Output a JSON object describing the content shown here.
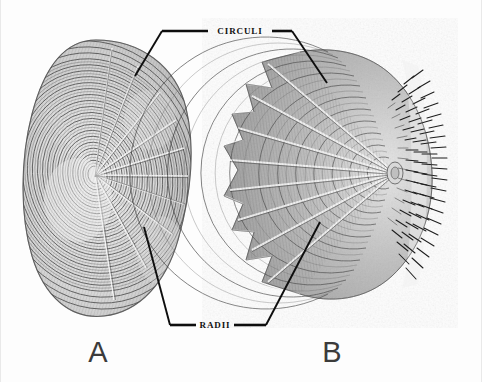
{
  "plate": {
    "background_color": "#fdfdfd",
    "ink_color": "#0e0e0e",
    "border_color": "#e9e9e9",
    "width": 482,
    "height": 382
  },
  "labels": {
    "circuli": "CIRCULI",
    "radii": "RADII"
  },
  "figures": {
    "a": {
      "letter": "A",
      "caption_x": 98,
      "caption_y": 362,
      "scale_type": "cycloid",
      "focus_x": 95,
      "focus_y": 175
    },
    "b": {
      "letter": "B",
      "caption_x": 332,
      "caption_y": 362,
      "scale_type": "ctenoid",
      "focus_x": 395,
      "focus_y": 173,
      "lobe_count": 7
    }
  },
  "leaders": {
    "circuli_left": {
      "bar_x1": 162,
      "bar_y1": 31,
      "bar_x2": 208,
      "bar_y2": 31,
      "diag_x1": 162,
      "diag_y1": 31,
      "diag_x2": 135,
      "diag_y2": 76
    },
    "circuli_right": {
      "bar_x1": 272,
      "bar_y1": 31,
      "bar_x2": 292,
      "bar_y2": 31,
      "diag_x1": 292,
      "diag_y1": 31,
      "diag_x2": 327,
      "diag_y2": 83
    },
    "radii_left": {
      "bar_x1": 170,
      "bar_y1": 325,
      "bar_x2": 196,
      "bar_y2": 325,
      "diag_x1": 144,
      "diag_y1": 227,
      "diag_x2": 170,
      "diag_y2": 325
    },
    "radii_right": {
      "bar_x1": 234,
      "bar_y1": 325,
      "bar_x2": 266,
      "bar_y2": 325,
      "diag_x1": 320,
      "diag_y1": 222,
      "diag_x2": 266,
      "diag_y2": 325
    }
  },
  "label_positions": {
    "circuli_x": 240,
    "circuli_y": 34,
    "radii_x": 215,
    "radii_y": 328
  }
}
